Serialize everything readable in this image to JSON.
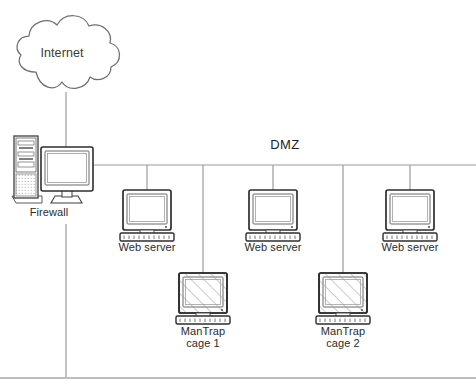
{
  "diagram": {
    "bus_label": "DMZ",
    "colors": {
      "line": "#8c8c8c",
      "outline": "#4a4a4a",
      "device_dark": "#3c3c3c",
      "device_fill": "#ffffff",
      "screen_fill": "#fdfdfd",
      "hatch": "#9a9a9a",
      "text": "#2b2b2b",
      "border": "#a8a8a8"
    },
    "nodes": [
      {
        "id": "internet",
        "type": "cloud",
        "label": "Internet",
        "x": 62,
        "y": 54
      },
      {
        "id": "firewall",
        "type": "tower-and-monitor",
        "label": "Firewall",
        "x": 49,
        "y": 212
      },
      {
        "id": "web-server-1",
        "type": "monitor-keyboard",
        "label": "Web server",
        "x": 147,
        "y": 247
      },
      {
        "id": "web-server-2",
        "type": "monitor-keyboard",
        "label": "Web server",
        "x": 273,
        "y": 247
      },
      {
        "id": "web-server-3",
        "type": "monitor-keyboard",
        "label": "Web server",
        "x": 410,
        "y": 247
      },
      {
        "id": "mantrap-cage-1",
        "type": "monitor-keyboard-hatched",
        "label_line1": "ManTrap",
        "label_line2": "cage 1",
        "x": 203,
        "y": 330
      },
      {
        "id": "mantrap-cage-2",
        "type": "monitor-keyboard-hatched",
        "label_line1": "ManTrap",
        "label_line2": "cage 2",
        "x": 343,
        "y": 330
      }
    ],
    "links": [
      {
        "id": "internet-to-firewall",
        "from": "internet",
        "to": "firewall"
      },
      {
        "id": "firewall-to-bus",
        "from": "firewall",
        "to": "dmz-bus"
      },
      {
        "id": "firewall-to-internal",
        "from": "firewall",
        "to": "internal-network"
      },
      {
        "id": "bus-to-web-server-1",
        "from": "dmz-bus",
        "to": "web-server-1"
      },
      {
        "id": "bus-to-web-server-2",
        "from": "dmz-bus",
        "to": "web-server-2"
      },
      {
        "id": "bus-to-web-server-3",
        "from": "dmz-bus",
        "to": "web-server-3"
      },
      {
        "id": "bus-to-mantrap-cage-1",
        "from": "dmz-bus",
        "to": "mantrap-cage-1"
      },
      {
        "id": "bus-to-mantrap-cage-2",
        "from": "dmz-bus",
        "to": "mantrap-cage-2"
      }
    ]
  }
}
